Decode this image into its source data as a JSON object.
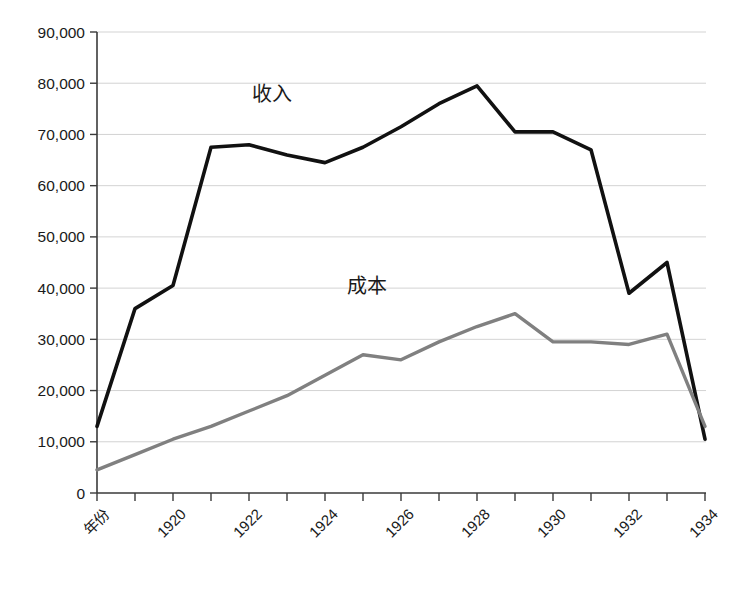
{
  "chart_data": {
    "type": "line",
    "title": "",
    "xlabel": "年份",
    "ylabel": "",
    "ylim": [
      0,
      90000
    ],
    "ytick_step": 10000,
    "grid": true,
    "legend": "inline-labels",
    "categories": [
      "年份",
      "1919",
      "1920",
      "1921",
      "1922",
      "1923",
      "1924",
      "1925",
      "1926",
      "1927",
      "1928",
      "1929",
      "1930",
      "1931",
      "1932",
      "1933",
      "1934"
    ],
    "x_tick_labels": [
      "年份",
      "",
      "1920",
      "",
      "1922",
      "",
      "1924",
      "",
      "1926",
      "",
      "1928",
      "",
      "1930",
      "",
      "1932",
      "",
      "1934"
    ],
    "y_tick_labels": [
      "90,000",
      "80,000",
      "70,000",
      "60,000",
      "50,000",
      "40,000",
      "30,000",
      "20,000",
      "10,000",
      "0"
    ],
    "y_tick_values": [
      90000,
      80000,
      70000,
      60000,
      50000,
      40000,
      30000,
      20000,
      10000,
      0
    ],
    "series": [
      {
        "name": "收入",
        "color": "#111111",
        "label_x_index": 4.6,
        "label_y_value": 76500,
        "values": [
          13000,
          36000,
          40500,
          67500,
          68000,
          66000,
          64500,
          67500,
          71500,
          76000,
          79500,
          70500,
          70500,
          67000,
          39000,
          45000,
          10500
        ]
      },
      {
        "name": "成本",
        "color": "#808080",
        "label_x_index": 7.1,
        "label_y_value": 39000,
        "values": [
          4500,
          7500,
          10500,
          13000,
          16000,
          19000,
          23000,
          27000,
          26000,
          29500,
          32500,
          35000,
          29500,
          29500,
          29000,
          31000,
          13000
        ]
      }
    ]
  },
  "colors": {
    "revenue_line": "#111111",
    "cost_line": "#808080",
    "gridline": "#c8c8c8",
    "axis": "#3a3a3a",
    "background": "#ffffff"
  }
}
